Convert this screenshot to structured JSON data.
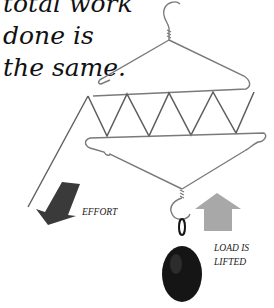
{
  "caption": {
    "lines": [
      "total work",
      "done is",
      "the same."
    ]
  },
  "labels": {
    "effort": "EFFORT",
    "load_line1": "LOAD IS",
    "load_line2": "LIFTED"
  },
  "colors": {
    "wire": "#7a7a7a",
    "effort_arrow": "#3a3a3a",
    "load_arrow": "#a8a8a8",
    "weight": "#151515"
  }
}
